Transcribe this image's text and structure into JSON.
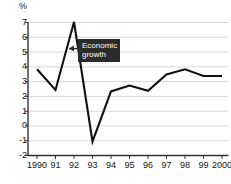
{
  "chart_data": {
    "type": "line",
    "title": "",
    "subtitle": "",
    "xlabel": "",
    "ylabel": "%",
    "unit_label": "%",
    "categories": [
      "1990",
      "91",
      "92",
      "93",
      "94",
      "95",
      "96",
      "97",
      "98",
      "99",
      "2000"
    ],
    "x": [
      1990,
      1991,
      1992,
      1993,
      1994,
      1995,
      1996,
      1997,
      1998,
      1999,
      2000
    ],
    "series": [
      {
        "name": "Economic growth",
        "values": [
          3.8,
          2.4,
          7.0,
          -1.1,
          2.3,
          2.7,
          2.35,
          3.45,
          3.8,
          3.35,
          3.35
        ]
      }
    ],
    "values": [
      3.8,
      2.4,
      7.0,
      -1.1,
      2.3,
      2.7,
      2.35,
      3.45,
      3.8,
      3.35,
      3.35
    ],
    "ylim": [
      -2,
      7
    ],
    "yticks": [
      -2,
      -1,
      0,
      1,
      2,
      3,
      4,
      5,
      6,
      7
    ],
    "ytick_labels": [
      "-2",
      "-1",
      "0",
      "1",
      "2",
      "3",
      "4",
      "5",
      "6",
      "7"
    ],
    "grid": true,
    "grid_axis": "y",
    "legend": "none",
    "annotations": [
      {
        "text": "Economic growth",
        "line1": "Economic",
        "line2": "growth",
        "target_x": 1992,
        "target_y": 5.2,
        "arrow": "left"
      }
    ],
    "colors": {
      "line": "#111111",
      "grid": "#d8d8d8",
      "axis": "#333333",
      "background": "#ffffff",
      "annotation_background": "#2b2b2b",
      "annotation_text": "#ffffff",
      "tick_text": "#151515"
    }
  }
}
